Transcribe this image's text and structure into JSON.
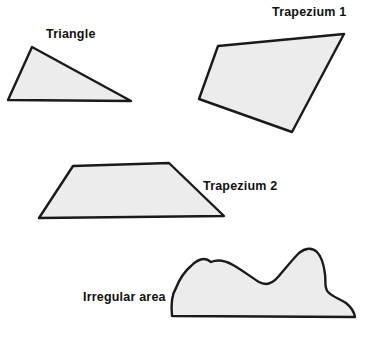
{
  "figure": {
    "background_color": "#ffffff",
    "shape_fill_color": "#ececec",
    "shape_stroke_color": "#1a1a1a",
    "label_color": "#111111",
    "width": 378,
    "height": 358
  },
  "labels": {
    "triangle": "Triangle",
    "trapezium_1": "Trapezium 1",
    "trapezium_2": "Trapezium 2",
    "irregular_area": "Irregular area"
  },
  "shapes": [
    {
      "name": "triangle",
      "label": "Triangle",
      "kind": "polygon",
      "vertices": [
        [
          32,
          47
        ],
        [
          131,
          101
        ],
        [
          8,
          100
        ]
      ]
    },
    {
      "name": "trapezium-1",
      "label": "Trapezium 1",
      "kind": "polygon",
      "vertices": [
        [
          218,
          46
        ],
        [
          344,
          34
        ],
        [
          292,
          132
        ],
        [
          199,
          99
        ]
      ]
    },
    {
      "name": "trapezium-2",
      "label": "Trapezium 2",
      "kind": "polygon",
      "vertices": [
        [
          73,
          166
        ],
        [
          169,
          163
        ],
        [
          224,
          216
        ],
        [
          39,
          218
        ]
      ]
    },
    {
      "name": "irregular-area",
      "label": "Irregular area",
      "kind": "freeform-closed-curve",
      "path": "M 172 316 C 171 306 172 296 176 288 C 180 278 185 272 191 266 C 197 260 203 256 210 263 C 215 262 223 262 231 265 C 241 269 251 277 259 282 C 266 286 272 285 278 278 C 285 270 292 261 299 254 C 305 249 311 248 316 252 C 322 257 324 266 325 274 C 326 281 325 288 328 292 C 332 297 339 299 345 303 C 351 307 354 311 355 317 Z",
      "baseline_y": 317,
      "baseline_x_range": [
        172,
        356
      ]
    }
  ]
}
